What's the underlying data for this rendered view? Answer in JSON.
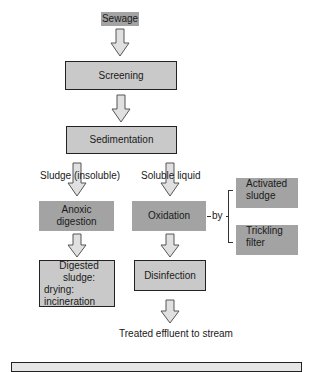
{
  "diagram": {
    "title_node": "Sewage",
    "nodes": {
      "screening": "Screening",
      "sedimentation": "Sedimentation",
      "anoxic_digestion_line1": "Anoxic",
      "anoxic_digestion_line2": "digestion",
      "oxidation": "Oxidation",
      "activated_sludge_line1": "Activated",
      "activated_sludge_line2": "sludge",
      "trickling_filter_line1": "Trickling",
      "trickling_filter_line2": "filter",
      "digested_sludge_line1": "Digested sludge:",
      "digested_sludge_line2": "drying:",
      "digested_sludge_line3": "incineration",
      "disinfection": "Disinfection"
    },
    "labels": {
      "sludge_branch": "Sludge (insoluble)",
      "liquid_branch": "Soluble liquid",
      "by": "by",
      "output": "Treated effluent to stream"
    },
    "colors": {
      "light_box": "#c9c9c9",
      "dark_box": "#a3a3a3",
      "arrow_fill": "#e0e0e0",
      "border": "#222222"
    }
  }
}
